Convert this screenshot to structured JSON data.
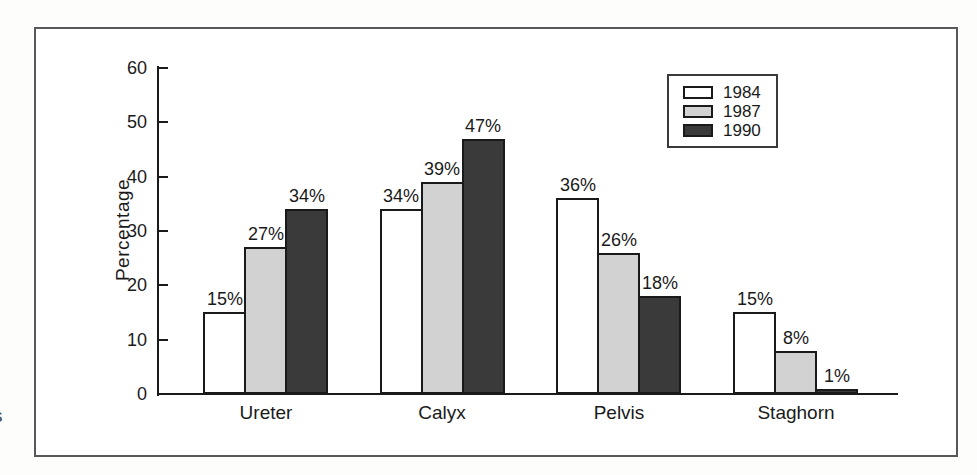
{
  "figure": {
    "margin_fragment": "s"
  },
  "chart_data": {
    "type": "bar",
    "title": "",
    "xlabel": "",
    "ylabel": "Percentage",
    "categories": [
      "Ureter",
      "Calyx",
      "Pelvis",
      "Staghorn"
    ],
    "series": [
      {
        "name": "1984",
        "color": "#ffffff",
        "values": [
          15,
          34,
          36,
          15
        ]
      },
      {
        "name": "1987",
        "color": "#d2d2d2",
        "values": [
          27,
          39,
          26,
          8
        ]
      },
      {
        "name": "1990",
        "color": "#3a3a3a",
        "values": [
          34,
          47,
          18,
          1
        ]
      }
    ],
    "value_labels": [
      [
        "15%",
        "34%",
        "36%",
        "15%"
      ],
      [
        "27%",
        "39%",
        "26%",
        "8%"
      ],
      [
        "34%",
        "47%",
        "18%",
        "1%"
      ]
    ],
    "ylim": [
      0,
      60
    ],
    "yticks": [
      0,
      10,
      20,
      30,
      40,
      50,
      60
    ],
    "grid": false,
    "legend_position": "top-right",
    "legend_entries": [
      "1984",
      "1987",
      "1990"
    ]
  },
  "style": {
    "background": "#ffffff",
    "frame_border": "#58585a",
    "axis_color": "#1a1a1a",
    "text_color": "#1a1a1a",
    "bar_border": "#1a1a1a"
  }
}
